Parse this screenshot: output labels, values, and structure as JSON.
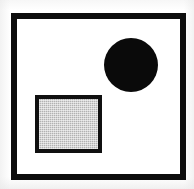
{
  "figure": {
    "canvas": {
      "width": 194,
      "height": 189,
      "background_color": "#ffffff"
    },
    "shapes": [
      {
        "name": "outer-frame",
        "type": "rectangle",
        "fill": "none",
        "fill_color": "#ffffff",
        "stroke_color": "#0d0d0d",
        "stroke_width": 6,
        "x": 11,
        "y": 13,
        "width": 175,
        "height": 167
      },
      {
        "name": "black-circle",
        "type": "circle",
        "fill": "solid",
        "fill_color": "#0a0a0a",
        "stroke_color": "none",
        "stroke_width": 0,
        "center_x": 131,
        "center_y": 65,
        "diameter": 54,
        "radius": 27,
        "position": "upper-right"
      },
      {
        "name": "gray-square",
        "type": "square",
        "fill": "solid",
        "fill_color": "#b2b2b2",
        "fill_pattern": "dithered-halftone",
        "stroke_color": "#101010",
        "stroke_width": 4,
        "x": 35,
        "y": 95,
        "width": 67,
        "height": 58,
        "position": "lower-left"
      }
    ],
    "colors": {
      "background": "#ffffff",
      "outline": "#0d0d0d",
      "circle_fill": "#0a0a0a",
      "square_fill": "#b2b2b2",
      "paper_tint": "#e8e8e8"
    }
  }
}
